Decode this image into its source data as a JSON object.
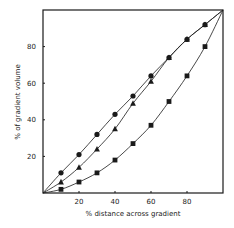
{
  "chart_data": {
    "type": "line",
    "title": "",
    "xlabel": "% distance across gradient",
    "ylabel": "% of gradient volume",
    "xlim": [
      0,
      100
    ],
    "ylim": [
      0,
      100
    ],
    "grid": false,
    "legend": null,
    "x_ticks": [
      20,
      40,
      60,
      80
    ],
    "y_ticks": [
      20,
      40,
      60,
      80
    ],
    "series": [
      {
        "name": "circles",
        "marker": "circle",
        "x": [
          0,
          10,
          20,
          30,
          40,
          50,
          60,
          70,
          80,
          90,
          100
        ],
        "y": [
          0,
          11,
          21,
          32,
          43,
          53,
          64,
          74,
          84,
          92,
          100
        ]
      },
      {
        "name": "triangles",
        "marker": "triangle",
        "x": [
          0,
          10,
          20,
          30,
          40,
          50,
          60,
          70,
          80,
          90,
          100
        ],
        "y": [
          0,
          6,
          14,
          24,
          35,
          49,
          61,
          74,
          84,
          92,
          100
        ]
      },
      {
        "name": "squares",
        "marker": "square",
        "x": [
          0,
          10,
          20,
          30,
          40,
          50,
          60,
          70,
          80,
          90,
          100
        ],
        "y": [
          0,
          2,
          6,
          11,
          18,
          27,
          37,
          50,
          64,
          80,
          100
        ]
      }
    ]
  },
  "colors": {
    "ink": "#1a1a1a",
    "background": "#ffffff"
  }
}
